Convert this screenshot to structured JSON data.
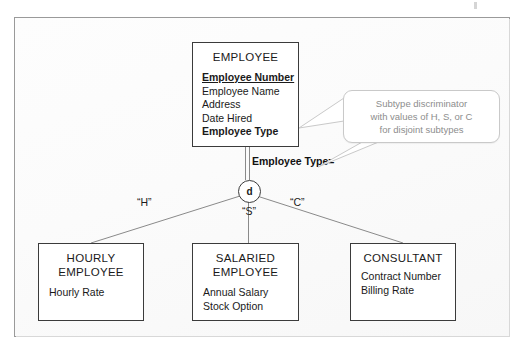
{
  "diagram": {
    "colors": {
      "entity_border": "#3b3b3b",
      "line": "#8a8a8a",
      "callout_text": "#8d8d8d",
      "frame_border": "#9a9a9a",
      "background": "#fbfbfb"
    },
    "supertype": {
      "name": "EMPLOYEE",
      "attributes": [
        {
          "label": "Employee Number",
          "style": "pk"
        },
        {
          "label": "Employee Name",
          "style": "plain"
        },
        {
          "label": "Address",
          "style": "plain"
        },
        {
          "label": "Date Hired",
          "style": "plain"
        },
        {
          "label": "Employee Type",
          "style": "bold"
        }
      ]
    },
    "discriminator": {
      "symbol": "d",
      "meaning": "disjoint",
      "attribute_label": "Employee Type="
    },
    "subtypes": [
      {
        "name": "HOURLY\nEMPLOYEE",
        "edge_label": "“H”",
        "attributes": [
          "Hourly Rate"
        ]
      },
      {
        "name": "SALARIED\nEMPLOYEE",
        "edge_label": "“S”",
        "attributes": [
          "Annual Salary",
          "Stock Option"
        ]
      },
      {
        "name": "CONSULTANT",
        "edge_label": "“C”",
        "attributes": [
          "Contract Number",
          "Billing Rate"
        ]
      }
    ],
    "callout": {
      "text": "Subtype discriminator\nwith values of H, S, or C\nfor disjoint subtypes"
    }
  }
}
